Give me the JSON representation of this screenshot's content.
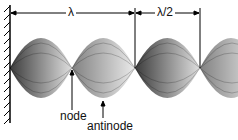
{
  "diagram": {
    "wavelength_label": "λ",
    "half_wavelength_label": "λ/2",
    "node_label": "node",
    "antinode_label": "antinode",
    "colors": {
      "wave": "#000000",
      "background": "#ffffff"
    }
  }
}
